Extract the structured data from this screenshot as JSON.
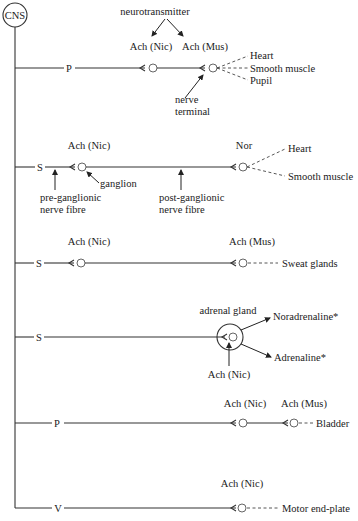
{
  "diagram": {
    "cns_label": "CNS",
    "neurotransmitter_label": "neurotransmitter",
    "pathways": [
      {
        "id": "parasympathetic-1",
        "division": "P",
        "synapse_labels": [
          "Ach (Nic)",
          "Ach (Mus)"
        ],
        "targets": [
          "Heart",
          "Smooth muscle",
          "Pupil"
        ],
        "annotation": [
          "nerve",
          "terminal"
        ]
      },
      {
        "id": "sympathetic-1",
        "division": "S",
        "synapse_labels": [
          "Ach (Nic)",
          "Nor"
        ],
        "targets": [
          "Heart",
          "Smooth muscle"
        ],
        "annotations": {
          "ganglion": "ganglion",
          "pre": [
            "pre-ganglionic",
            "nerve fibre"
          ],
          "post": [
            "post-ganglionic",
            "nerve fibre"
          ]
        }
      },
      {
        "id": "sympathetic-2",
        "division": "S",
        "synapse_labels": [
          "Ach (Nic)",
          "Ach (Mus)"
        ],
        "targets": [
          "Sweat glands"
        ]
      },
      {
        "id": "sympathetic-adrenal",
        "division": "S",
        "gland_label": "adrenal gland",
        "synapse_label": "Ach (Nic)",
        "outputs": [
          "Noradrenaline*",
          "Adrenaline*"
        ]
      },
      {
        "id": "parasympathetic-2",
        "division": "P",
        "synapse_labels": [
          "Ach (Nic)",
          "Ach (Mus)"
        ],
        "targets": [
          "Bladder"
        ]
      },
      {
        "id": "somatic",
        "division": "V",
        "synapse_label": "Ach (Nic)",
        "targets": [
          "Motor end-plate"
        ]
      }
    ]
  }
}
